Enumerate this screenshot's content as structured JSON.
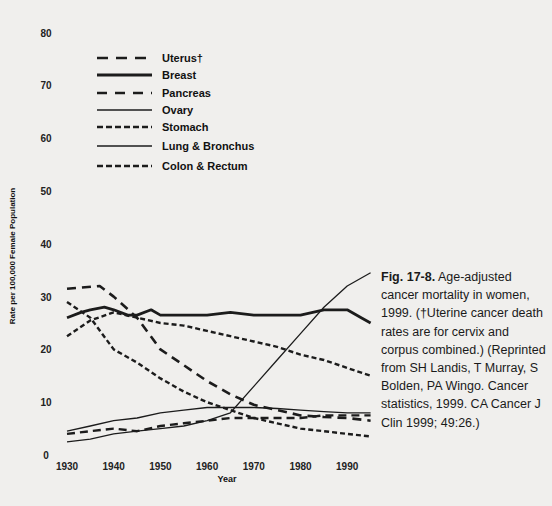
{
  "chart_data": {
    "type": "line",
    "title": "",
    "xlabel": "Year",
    "ylabel": "Rate per 100,000 Female Population",
    "xlim": [
      1930,
      1996
    ],
    "ylim": [
      0,
      80
    ],
    "x_ticks": [
      "1930",
      "1940",
      "1950",
      "1960",
      "1970",
      "1980",
      "1990"
    ],
    "y_ticks": [
      "0",
      "10",
      "20",
      "30",
      "40",
      "50",
      "60",
      "70",
      "80"
    ],
    "grid": false,
    "legend_position": "upper-left",
    "series": [
      {
        "name": "Uterus†",
        "style": "long-dash",
        "x": [
          1930,
          1937,
          1940,
          1945,
          1950,
          1955,
          1960,
          1965,
          1970,
          1975,
          1980,
          1985,
          1990,
          1995
        ],
        "values": [
          31.5,
          32,
          30,
          26,
          20,
          17,
          14,
          11.5,
          9.5,
          8.5,
          7.5,
          7.2,
          7,
          6.5
        ]
      },
      {
        "name": "Breast",
        "style": "thick-solid",
        "x": [
          1930,
          1933,
          1935,
          1938,
          1940,
          1943,
          1945,
          1948,
          1950,
          1955,
          1960,
          1965,
          1970,
          1975,
          1980,
          1985,
          1988,
          1990,
          1993,
          1995
        ],
        "values": [
          26,
          27,
          27.5,
          28,
          27.5,
          26.5,
          26.5,
          27.5,
          26.5,
          26.5,
          26.5,
          27,
          26.5,
          26.5,
          26.5,
          27.5,
          27.5,
          27.5,
          26,
          25
        ]
      },
      {
        "name": "Pancreas",
        "style": "medium-dash",
        "x": [
          1930,
          1935,
          1940,
          1945,
          1950,
          1955,
          1960,
          1965,
          1970,
          1975,
          1980,
          1985,
          1990,
          1995
        ],
        "values": [
          4,
          4.5,
          5,
          4.5,
          5.5,
          6,
          6.5,
          7,
          7,
          7,
          7,
          7.5,
          7.5,
          7.5
        ]
      },
      {
        "name": "Ovary",
        "style": "thin-solid",
        "x": [
          1930,
          1935,
          1940,
          1945,
          1950,
          1955,
          1960,
          1965,
          1970,
          1975,
          1980,
          1985,
          1990,
          1995
        ],
        "values": [
          4.5,
          5.5,
          6.5,
          7,
          8,
          8.5,
          9,
          9,
          9,
          8.8,
          8.5,
          8.2,
          8,
          8
        ]
      },
      {
        "name": "Stomach",
        "style": "short-dash",
        "x": [
          1930,
          1935,
          1940,
          1945,
          1950,
          1955,
          1960,
          1965,
          1970,
          1975,
          1980,
          1985,
          1990,
          1995
        ],
        "values": [
          29,
          26,
          20,
          17.5,
          14.5,
          12,
          10,
          8.5,
          7,
          6,
          5,
          4.5,
          4,
          3.5
        ]
      },
      {
        "name": "Lung & Bronchus",
        "style": "thin-solid",
        "x": [
          1930,
          1935,
          1940,
          1945,
          1950,
          1955,
          1960,
          1965,
          1970,
          1975,
          1980,
          1985,
          1990,
          1995
        ],
        "values": [
          2.5,
          3,
          4,
          4.5,
          5,
          5.5,
          6.5,
          8,
          13,
          18,
          23,
          28,
          32,
          34.5
        ]
      },
      {
        "name": "Colon & Rectum",
        "style": "short-dash",
        "x": [
          1930,
          1935,
          1940,
          1945,
          1950,
          1955,
          1960,
          1965,
          1970,
          1975,
          1980,
          1985,
          1990,
          1995
        ],
        "values": [
          22.5,
          25.5,
          27,
          26,
          25,
          24.5,
          23.5,
          22.5,
          21.5,
          20.5,
          19,
          18,
          16.5,
          15
        ]
      }
    ]
  },
  "legend": {
    "items": [
      {
        "label": "Uterus†"
      },
      {
        "label": "Breast"
      },
      {
        "label": "Pancreas"
      },
      {
        "label": "Ovary"
      },
      {
        "label": "Stomach"
      },
      {
        "label": "Lung & Bronchus"
      },
      {
        "label": "Colon & Rectum"
      }
    ]
  },
  "axes": {
    "ylabel": "Rate per 100,000 Female Population",
    "xlabel": "Year"
  },
  "caption": {
    "figure_label": "Fig. 17-8.",
    "text": " Age-adjusted cancer mortality in women, 1999. (†Uterine cancer death rates are for cervix and corpus combined.) (Reprinted from SH Landis, T Murray, S Bolden, PA Wingo. Cancer statistics, 1999. CA Cancer J Clin 1999; 49:26.)"
  },
  "colors": {
    "background": "#f0efed",
    "line": "#1c1c1c"
  }
}
